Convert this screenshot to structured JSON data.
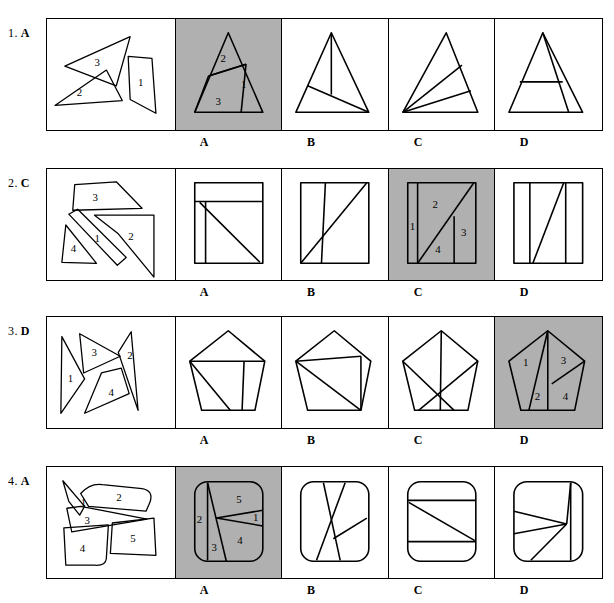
{
  "page": {
    "background": "#ffffff",
    "ink": "#000000",
    "highlight_fill": "#b0b0b0",
    "option_letters": [
      "A",
      "B",
      "C",
      "D"
    ]
  },
  "rows": [
    {
      "number": "1.",
      "answer": "A",
      "pieces_labels": [
        "3",
        "1",
        "2"
      ],
      "correct_index": 0,
      "shape": "triangle",
      "options": [
        {
          "letter": "A",
          "piece_numbers": [
            "2",
            "1",
            "3"
          ],
          "shaded": true
        },
        {
          "letter": "B",
          "piece_numbers": [],
          "shaded": false
        },
        {
          "letter": "C",
          "piece_numbers": [],
          "shaded": false
        },
        {
          "letter": "D",
          "piece_numbers": [],
          "shaded": false
        }
      ]
    },
    {
      "number": "2.",
      "answer": "C",
      "pieces_labels": [
        "3",
        "2",
        "1",
        "4"
      ],
      "correct_index": 2,
      "shape": "rectangle",
      "options": [
        {
          "letter": "A",
          "piece_numbers": [],
          "shaded": false
        },
        {
          "letter": "B",
          "piece_numbers": [],
          "shaded": false
        },
        {
          "letter": "C",
          "piece_numbers": [
            "1",
            "2",
            "3",
            "4"
          ],
          "shaded": true
        },
        {
          "letter": "D",
          "piece_numbers": [],
          "shaded": false
        }
      ]
    },
    {
      "number": "3.",
      "answer": "D",
      "pieces_labels": [
        "1",
        "3",
        "2",
        "4"
      ],
      "correct_index": 3,
      "shape": "pentagon",
      "options": [
        {
          "letter": "A",
          "piece_numbers": [],
          "shaded": false
        },
        {
          "letter": "B",
          "piece_numbers": [],
          "shaded": false
        },
        {
          "letter": "C",
          "piece_numbers": [],
          "shaded": false
        },
        {
          "letter": "D",
          "piece_numbers": [
            "1",
            "3",
            "2",
            "4"
          ],
          "shaded": true
        }
      ]
    },
    {
      "number": "4.",
      "answer": "A",
      "pieces_labels": [
        "1",
        "2",
        "3",
        "4",
        "5"
      ],
      "correct_index": 0,
      "shape": "rounded-square",
      "options": [
        {
          "letter": "A",
          "piece_numbers": [
            "5",
            "2",
            "1",
            "3",
            "4"
          ],
          "shaded": true
        },
        {
          "letter": "B",
          "piece_numbers": [],
          "shaded": false
        },
        {
          "letter": "C",
          "piece_numbers": [],
          "shaded": false
        },
        {
          "letter": "D",
          "piece_numbers": [],
          "shaded": false
        }
      ]
    }
  ]
}
